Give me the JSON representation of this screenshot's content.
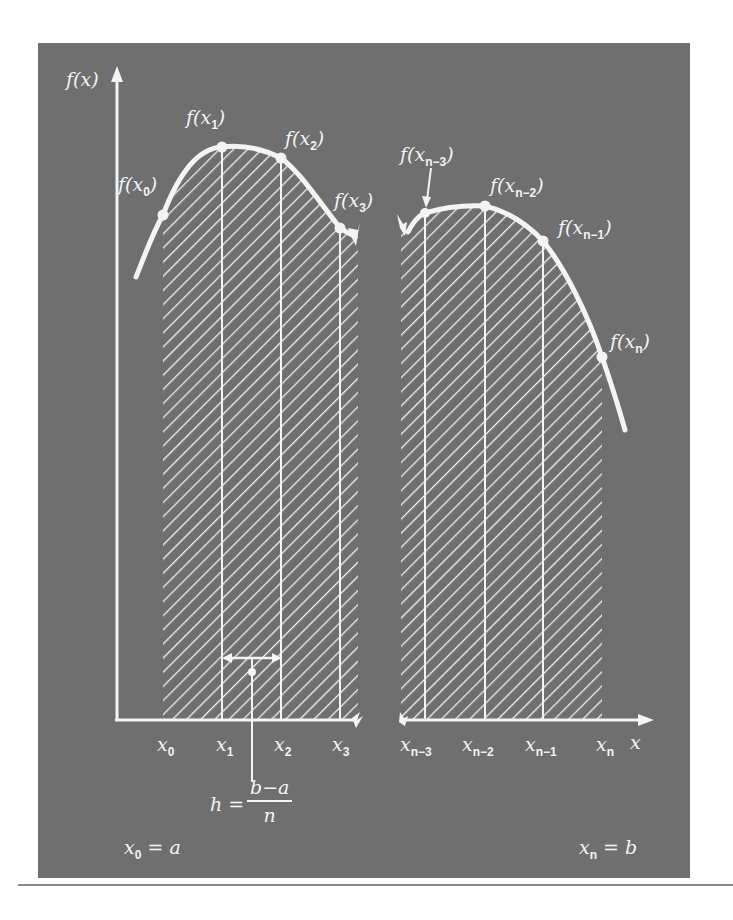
{
  "figure": {
    "background_color": "#6f6f6f",
    "foreground_color": "#f4f4f4",
    "axes": {
      "y_label": "f(x)",
      "x_label": "x"
    },
    "point_labels": {
      "f_x0": {
        "fn": "f(x",
        "sub": "0",
        "close": ")"
      },
      "f_x1": {
        "fn": "f(x",
        "sub": "1",
        "close": ")"
      },
      "f_x2": {
        "fn": "f(x",
        "sub": "2",
        "close": ")"
      },
      "f_x3": {
        "fn": "f(x",
        "sub": "3",
        "close": ")"
      },
      "f_xn3": {
        "fn": "f(x",
        "sub": "n−3",
        "close": ")"
      },
      "f_xn2": {
        "fn": "f(x",
        "sub": "n−2",
        "close": ")"
      },
      "f_xn1": {
        "fn": "f(x",
        "sub": "n−1",
        "close": ")"
      },
      "f_xn": {
        "fn": "f(x",
        "sub": "n",
        "close": ")"
      }
    },
    "tick_labels": {
      "x0": {
        "base": "x",
        "sub": "0"
      },
      "x1": {
        "base": "x",
        "sub": "1"
      },
      "x2": {
        "base": "x",
        "sub": "2"
      },
      "x3": {
        "base": "x",
        "sub": "3"
      },
      "xn3": {
        "base": "x",
        "sub": "n−3"
      },
      "xn2": {
        "base": "x",
        "sub": "n−2"
      },
      "xn1": {
        "base": "x",
        "sub": "n−1"
      },
      "xn": {
        "base": "x",
        "sub": "n"
      }
    },
    "step_formula": {
      "lhs": "h =",
      "numerator": "b−a",
      "denominator": "n"
    },
    "bounds": {
      "lower": {
        "base": "x",
        "sub": "0",
        "rhs": " = a"
      },
      "upper": {
        "base": "x",
        "sub": "n",
        "rhs": " = b"
      }
    }
  }
}
